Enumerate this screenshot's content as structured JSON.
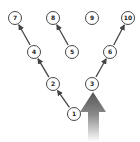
{
  "diagram": {
    "type": "tree",
    "colors": {
      "node_stroke": "#333333",
      "node_fill": "#ffffff",
      "edge": "#444444",
      "big_arrow_top": "#555555",
      "big_arrow_bottom": "#ffffff"
    },
    "nodes": [
      {
        "id": "1",
        "label": "1",
        "x": 74,
        "y": 114
      },
      {
        "id": "2",
        "label": "2",
        "x": 53,
        "y": 84
      },
      {
        "id": "3",
        "label": "3",
        "x": 92,
        "y": 84
      },
      {
        "id": "4",
        "label": "4",
        "x": 34,
        "y": 52
      },
      {
        "id": "5",
        "label": "5",
        "x": 72,
        "y": 52
      },
      {
        "id": "6",
        "label": "6",
        "x": 110,
        "y": 52
      },
      {
        "id": "7",
        "label": "7",
        "x": 15,
        "y": 18
      },
      {
        "id": "8",
        "label": "8",
        "x": 53,
        "y": 18
      },
      {
        "id": "9",
        "label": "9",
        "x": 92,
        "y": 18
      },
      {
        "id": "10",
        "label": "10",
        "x": 128,
        "y": 18
      }
    ],
    "edges": [
      {
        "from": "1",
        "to": "2"
      },
      {
        "from": "2",
        "to": "4"
      },
      {
        "from": "4",
        "to": "7"
      },
      {
        "from": "5",
        "to": "8"
      },
      {
        "from": "3",
        "to": "6"
      },
      {
        "from": "6",
        "to": "10"
      }
    ],
    "big_arrow": {
      "label": "upward-arrow",
      "tip_x": 93,
      "tip_y": 92
    }
  }
}
